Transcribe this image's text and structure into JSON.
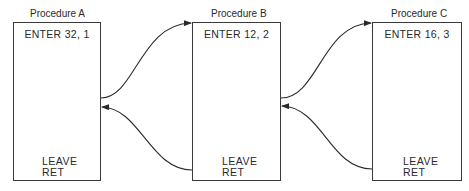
{
  "diagram": {
    "procedures": [
      {
        "title": "Procedure A",
        "enter": "ENTER 32, 1",
        "leave": "LEAVE",
        "ret": "RET"
      },
      {
        "title": "Procedure B",
        "enter": "ENTER 12, 2",
        "leave": "LEAVE",
        "ret": "RET"
      },
      {
        "title": "Procedure C",
        "enter": "ENTER 16, 3",
        "leave": "LEAVE",
        "ret": "RET"
      }
    ],
    "connections": [
      {
        "from": "Procedure A",
        "to": "Procedure B",
        "type": "call"
      },
      {
        "from": "Procedure B",
        "to": "Procedure A",
        "type": "return"
      },
      {
        "from": "Procedure B",
        "to": "Procedure C",
        "type": "call"
      },
      {
        "from": "Procedure C",
        "to": "Procedure B",
        "type": "return"
      }
    ]
  }
}
